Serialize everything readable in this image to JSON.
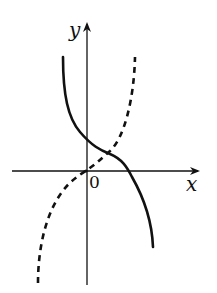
{
  "diagram": {
    "type": "function-graph",
    "labels": {
      "y_axis": "y",
      "x_axis": "x",
      "origin": "0"
    },
    "curves": [
      {
        "name": "solid-curve",
        "style": "solid",
        "description": "decreasing curve, starts top-left of y-axis, crosses y-axis above origin, crosses x-axis on positive side, ends bottom-right"
      },
      {
        "name": "dashed-curve",
        "style": "dashed",
        "description": "increasing curve, starts bottom-left, passes through near origin, rises steeply to top-right"
      }
    ],
    "colors": {
      "stroke": "#111111",
      "background": "#ffffff"
    }
  }
}
